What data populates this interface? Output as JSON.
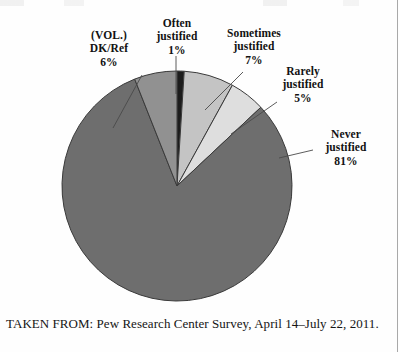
{
  "figure": {
    "caption": "TAKEN FROM: Pew Research Center Survey, April 14–July 22, 2011."
  },
  "labels": {
    "dkref": {
      "line1": "(VOL.)",
      "line2": "DK/Ref",
      "pct": "6%"
    },
    "often": {
      "line1": "Often",
      "line2": "justified",
      "pct": "1%"
    },
    "sometimes": {
      "line1": "Sometimes",
      "line2": "justified",
      "pct": "7%"
    },
    "rarely": {
      "line1": "Rarely",
      "line2": "justified",
      "pct": "5%"
    },
    "never": {
      "line1": "Never",
      "line2": "justified",
      "pct": "81%"
    }
  },
  "chart_data": {
    "type": "pie",
    "title": "",
    "subtitle": "",
    "xlabel": "",
    "ylabel": "",
    "legend_position": "callout-labels",
    "grid": false,
    "units": "percent",
    "start_angle_deg": 0,
    "direction": "clockwise",
    "center": {
      "x": 177,
      "y": 186
    },
    "radius": 115,
    "categories": [
      "Often justified",
      "Sometimes justified",
      "Rarely justified",
      "Never justified",
      "(VOL.) DK/Ref"
    ],
    "values": [
      1,
      7,
      5,
      81,
      6
    ],
    "colors": [
      "#1c1c1c",
      "#c4c4c4",
      "#dedede",
      "#6e6e6e",
      "#919191"
    ],
    "slices": [
      {
        "name": "Often justified",
        "value": 1,
        "label": "1%",
        "color": "#1c1c1c"
      },
      {
        "name": "Sometimes justified",
        "value": 7,
        "label": "7%",
        "color": "#c4c4c4"
      },
      {
        "name": "Rarely justified",
        "value": 5,
        "label": "5%",
        "color": "#dedede"
      },
      {
        "name": "Never justified",
        "value": 81,
        "label": "81%",
        "color": "#6e6e6e"
      },
      {
        "name": "(VOL.) DK/Ref",
        "value": 6,
        "label": "6%",
        "color": "#919191"
      }
    ]
  },
  "style": {
    "background": "#fefefe",
    "outline": "#3a3a3a",
    "leader_line": "#4a4a4a",
    "text": "#121212"
  }
}
